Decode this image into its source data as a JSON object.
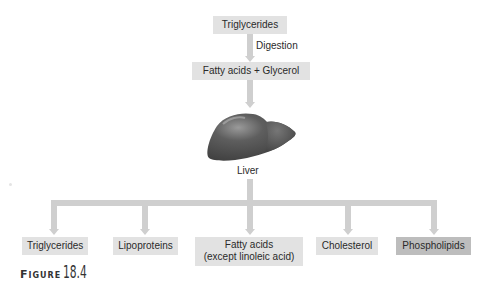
{
  "diagram": {
    "input": "Triglycerides",
    "step_label": "Digestion",
    "product": "Fatty acids + Glycerol",
    "organ": {
      "icon": "liver-icon",
      "label": "Liver"
    },
    "outputs": [
      {
        "label": "Triglycerides",
        "highlighted": false
      },
      {
        "label": "Lipoproteins",
        "highlighted": false
      },
      {
        "label_line1": "Fatty acids",
        "label_line2": "(except linoleic acid)",
        "highlighted": false
      },
      {
        "label": "Cholesterol",
        "highlighted": false
      },
      {
        "label": "Phospholipids",
        "highlighted": true
      }
    ]
  },
  "caption": {
    "word": "Figure",
    "number": "18.4"
  },
  "colors": {
    "box": "#e2e2e2",
    "box_highlight": "#bdbdbd",
    "arrow": "#cfcfcf",
    "liver": "#5a5a5a"
  }
}
